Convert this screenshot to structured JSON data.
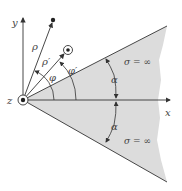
{
  "figure": {
    "axes": {
      "x_label": "x",
      "y_label": "y",
      "z_label": "z"
    },
    "vectors": {
      "rho_label": "ρ",
      "rho_prime_label": "ρ′"
    },
    "angles": {
      "phi_label": "φ",
      "phi_prime_label": "φ′",
      "alpha_upper_label": "α",
      "alpha_lower_label": "α"
    },
    "regions": {
      "upper_sigma_label": "σ = ∞",
      "lower_sigma_label": "σ = ∞"
    },
    "colors": {
      "wedge_fill": "#dcdcdc",
      "line": "#333333",
      "text": "#444444"
    }
  }
}
